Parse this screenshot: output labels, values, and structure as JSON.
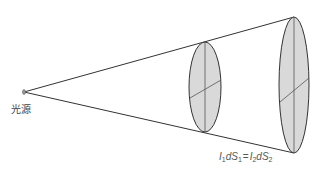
{
  "diagram": {
    "source_label": "光源",
    "formula": {
      "I1": "I",
      "sub1": "1",
      "dS1": "dS",
      "sub_s1": "1",
      "eq": "=",
      "I2": "I",
      "sub2": "2",
      "dS2": "dS",
      "sub_s2": "2"
    },
    "formula_text": "I₁dS₁ = I₂dS₂",
    "colors": {
      "line": "#333333",
      "ellipse_fill": "#d9d9d9",
      "ellipse_stroke": "#333333"
    },
    "elements": {
      "source_point": {
        "x": 24,
        "y": 92
      },
      "near_surface": {
        "cx": 205,
        "cy": 87,
        "rx": 16,
        "ry": 45
      },
      "far_surface": {
        "cx": 294,
        "cy": 85,
        "rx": 15,
        "ry": 68
      }
    }
  }
}
